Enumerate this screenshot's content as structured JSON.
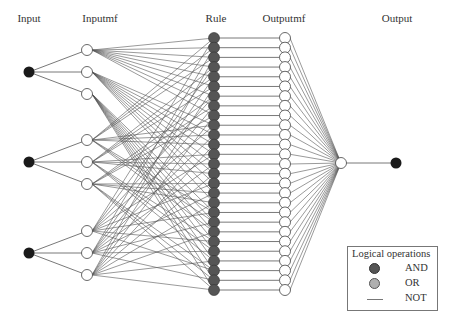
{
  "layers": {
    "input": "Input",
    "inputmf": "Inputmf",
    "rule": "Rule",
    "outputmf": "Outputmf",
    "output": "Output"
  },
  "legend": {
    "title": "Logical operations",
    "items": [
      {
        "label": "AND",
        "symbol": "dark-circle"
      },
      {
        "label": "OR",
        "symbol": "light-circle"
      },
      {
        "label": "NOT",
        "symbol": "line"
      }
    ]
  },
  "structure": {
    "num_inputs": 3,
    "mfs_per_input": 3,
    "num_rules": 27,
    "num_outputmfs": 27,
    "num_outputs": 1
  },
  "colors": {
    "input_node": "#1a1a1a",
    "rule_node": "#555555",
    "or_node": "#b0b0b0",
    "mf_node": "#ffffff",
    "edge": "#555555",
    "output_node": "#1a1a1a"
  }
}
